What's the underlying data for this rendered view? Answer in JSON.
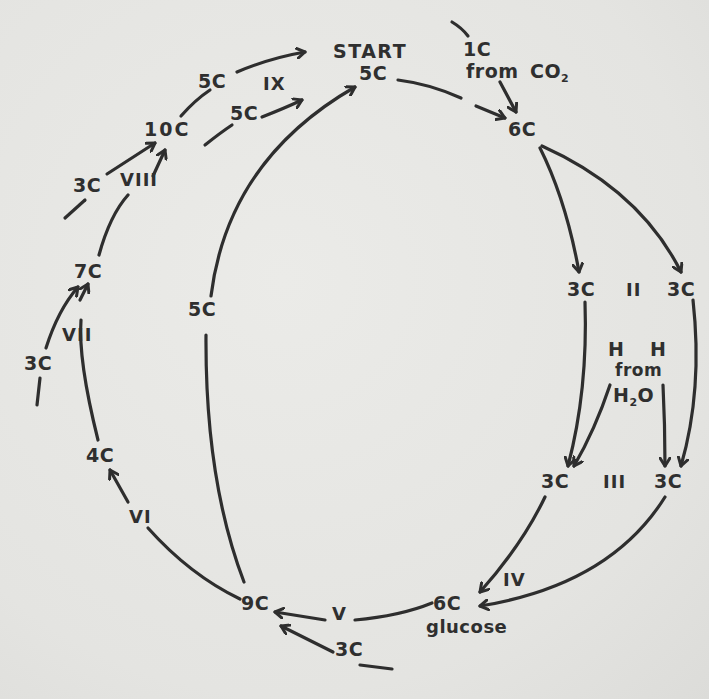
{
  "diagram": {
    "type": "cycle",
    "ink_color": "#2e2e2e",
    "paper_color": "#e6e6e3",
    "nodes": {
      "start_label": "START",
      "start": "5C",
      "co2_in": "1C",
      "co2_from": "from",
      "co2_source": "CO",
      "co2_sub": "2",
      "six_c_top": "6C",
      "three_c_left_a": "3C",
      "three_c_right_a": "3C",
      "h_left": "H",
      "h_right": "H",
      "h_from": "from",
      "h2o_h": "H",
      "h2o_sub": "2",
      "h2o_o": "O",
      "three_c_left_b": "3C",
      "three_c_right_b": "3C",
      "six_c_glucose": "6C",
      "glucose": "glucose",
      "three_c_bottom": "3C",
      "nine_c": "9C",
      "five_c_inner": "5C",
      "four_c": "4C",
      "three_c_side": "3C",
      "seven_c": "7C",
      "three_c_upper": "3C",
      "ten_c": "10C",
      "five_c_top": "5C",
      "five_c_second": "5C"
    },
    "steps": {
      "ii": "II",
      "iii": "III",
      "iv": "IV",
      "v": "V",
      "vi": "VI",
      "vii": "VII",
      "viii": "VIII",
      "ix": "IX"
    }
  }
}
